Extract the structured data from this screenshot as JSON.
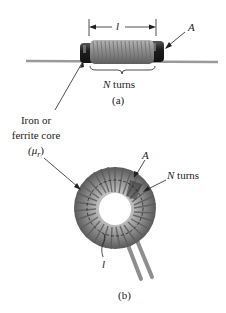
{
  "figure": {
    "panel_a": {
      "length_symbol": "l",
      "area_symbol": "A",
      "turns_symbol": "N",
      "turns_text": "turns",
      "caption": "(a)"
    },
    "core_label": {
      "line1": "Iron or",
      "line2": "ferrite core",
      "line3": "(μ",
      "line3_sub": "r",
      "line3_end": ")"
    },
    "panel_b": {
      "area_symbol": "A",
      "turns_symbol": "N",
      "turns_text": "turns",
      "length_symbol": "l",
      "caption": "(b)"
    },
    "colors": {
      "coil": "#8a8a8a",
      "coil_dark": "#5a5a5a",
      "core": "#2a2a2a",
      "wire": "#9a9a9a",
      "line": "#222222"
    }
  }
}
